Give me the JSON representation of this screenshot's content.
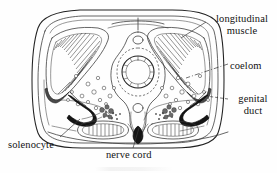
{
  "figure": {
    "kind": "biological-cross-section",
    "background_color": "#fefefe",
    "ink_color": "#222222"
  },
  "labels": {
    "longitudinal_muscle": "longitudinal muscle",
    "longitudinal_muscle_line1": "longitudinal",
    "longitudinal_muscle_line2": "muscle",
    "coelom": "coelom",
    "genital_duct": "genital duct",
    "genital_duct_line1": "genital",
    "genital_duct_line2": "duct",
    "solenocyte": "solenocyte",
    "nerve_cord": "nerve cord"
  },
  "leaders": [
    {
      "name": "longitudinal-muscle-leader",
      "from": [
        206,
        22
      ],
      "to": [
        181,
        38
      ]
    },
    {
      "name": "coelom-leader",
      "from": [
        228,
        64
      ],
      "to": [
        186,
        77
      ],
      "style": "dash-dot"
    },
    {
      "name": "genital-duct-leader",
      "from": [
        228,
        99
      ],
      "to": [
        205,
        96
      ],
      "style": "dashed"
    },
    {
      "name": "solenocyte-leader",
      "from": [
        60,
        137
      ],
      "to": [
        78,
        120
      ]
    },
    {
      "name": "nerve-cord-leader",
      "from": [
        133,
        147
      ],
      "to": [
        140,
        128
      ]
    }
  ],
  "structures": [
    {
      "name": "body-wall-outer",
      "description": "rounded rectangular body outline"
    },
    {
      "name": "body-wall-inner",
      "description": "inner epidermal boundary"
    },
    {
      "name": "longitudinal-muscle-left",
      "description": "left striated muscle band"
    },
    {
      "name": "longitudinal-muscle-right",
      "description": "right striated muscle band"
    },
    {
      "name": "coelom-left",
      "description": "left coelomic cavity"
    },
    {
      "name": "coelom-right",
      "description": "right coelomic cavity"
    },
    {
      "name": "notochord",
      "description": "central concentric notochord"
    },
    {
      "name": "nerve-cord",
      "description": "dorsal nerve cord, dark wedge at ventral midline"
    },
    {
      "name": "genital-duct-left",
      "description": "left gonad duct"
    },
    {
      "name": "genital-duct-right",
      "description": "right gonad duct"
    },
    {
      "name": "solenocyte-cluster",
      "description": "nephridial solenocyte cells"
    },
    {
      "name": "ventral-sac-left",
      "description": "left striated ventral pouch"
    },
    {
      "name": "ventral-sac-right",
      "description": "right striated ventral pouch"
    }
  ]
}
